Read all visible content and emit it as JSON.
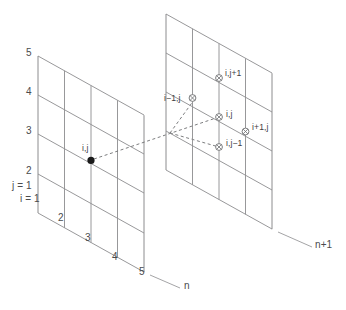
{
  "figure": {
    "type": "diagram",
    "background_color": "#ffffff",
    "line_color": "#8c8c8e",
    "text_color": "#4f5052",
    "dot_color": "#1a1a1a"
  },
  "left_plane": {
    "plane_label": "n",
    "j_axis_ticks": [
      "5",
      "4",
      "3",
      "2"
    ],
    "j_origin_label": "j = 1",
    "i_origin_label": "i = 1",
    "i_axis_ticks": [
      "2",
      "3",
      "4",
      "5"
    ],
    "point_label": "i,j"
  },
  "right_plane": {
    "plane_label": "n+1",
    "nodes": [
      {
        "label": "i,j+1"
      },
      {
        "label": "i−1,j"
      },
      {
        "label": "i,j"
      },
      {
        "label": "i+1,j"
      },
      {
        "label": "i,j−1"
      }
    ]
  },
  "caption": {
    "text": ""
  }
}
